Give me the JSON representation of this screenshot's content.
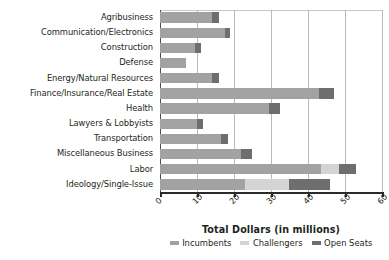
{
  "chart_data": {
    "type": "bar",
    "orientation": "horizontal",
    "stacked": true,
    "title": "",
    "xlabel": "Total Dollars (in millions)",
    "ylabel": "",
    "xlim": [
      0,
      60
    ],
    "xticks": [
      0,
      10,
      20,
      30,
      40,
      50,
      60
    ],
    "xtick_labels": [
      "0",
      "10",
      "20",
      "30",
      "40",
      "50",
      "60"
    ],
    "grid": "vertical",
    "legend_position": "bottom-center",
    "categories": [
      "Agribusiness",
      "Communication/Electronics",
      "Construction",
      "Defense",
      "Energy/Natural Resources",
      "Finance/Insurance/Real Estate",
      "Health",
      "Lawyers & Lobbyists",
      "Transportation",
      "Miscellaneous Business",
      "Labor",
      "Ideology/Single-Issue"
    ],
    "series": [
      {
        "name": "Incumbents",
        "color": "#a2a2a2",
        "values": [
          14.0,
          17.5,
          9.5,
          7.0,
          14.0,
          43.0,
          29.5,
          10.0,
          16.5,
          22.0,
          43.5,
          23.0
        ]
      },
      {
        "name": "Challengers",
        "color": "#d4d4d4",
        "values": [
          0.0,
          0.0,
          0.0,
          0.0,
          0.0,
          0.0,
          0.0,
          0.0,
          0.0,
          0.0,
          5.0,
          12.0
        ]
      },
      {
        "name": "Open Seats",
        "color": "#6e6e6e",
        "values": [
          2.0,
          1.5,
          1.5,
          0.0,
          2.0,
          4.0,
          3.0,
          1.5,
          2.0,
          3.0,
          4.5,
          11.0
        ]
      }
    ],
    "totals": [
      16.0,
      19.0,
      11.0,
      7.0,
      16.0,
      47.0,
      32.5,
      11.5,
      18.5,
      25.0,
      53.0,
      46.0
    ]
  },
  "axis": {
    "x_title": "Total Dollars (in millions)",
    "ticks": [
      "0",
      "10",
      "20",
      "30",
      "40",
      "50",
      "60"
    ]
  },
  "legend": {
    "items": [
      {
        "label": "Incumbents",
        "color": "#a2a2a2"
      },
      {
        "label": "Challengers",
        "color": "#d4d4d4"
      },
      {
        "label": "Open Seats",
        "color": "#6e6e6e"
      }
    ]
  },
  "colors": {
    "incumbents": "#a2a2a2",
    "challengers": "#d4d4d4",
    "open_seats": "#6e6e6e",
    "gridline": "#b9b9b9",
    "axis": "#2b2b2b",
    "text": "#231f20",
    "background": "#ffffff"
  }
}
